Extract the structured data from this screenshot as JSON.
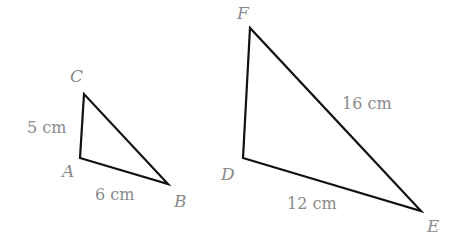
{
  "diagram": {
    "triangles": [
      {
        "name": "ABC",
        "vertices": {
          "A": {
            "label": "A",
            "x": 80,
            "y": 158
          },
          "B": {
            "label": "B",
            "x": 168,
            "y": 184
          },
          "C": {
            "label": "C",
            "x": 84,
            "y": 94
          }
        },
        "sides": {
          "AC": "5 cm",
          "AB": "6 cm"
        }
      },
      {
        "name": "DEF",
        "vertices": {
          "D": {
            "label": "D",
            "x": 243,
            "y": 158
          },
          "E": {
            "label": "E",
            "x": 421,
            "y": 211
          },
          "F": {
            "label": "F",
            "x": 250,
            "y": 28
          }
        },
        "sides": {
          "DE": "12 cm",
          "EF": "16 cm"
        }
      }
    ],
    "colors": {
      "line": "#111111",
      "label": "#8a8a8a"
    }
  }
}
